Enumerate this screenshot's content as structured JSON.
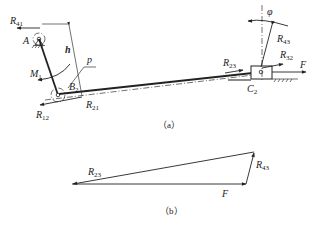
{
  "figure": {
    "part_a": {
      "caption": "（a）",
      "labels": {
        "R41": {
          "main": "R",
          "sub": "41"
        },
        "A": "A",
        "h": "h",
        "p": "p",
        "M1": {
          "main": "M",
          "sub": "1"
        },
        "B2": {
          "main": "B",
          "sub": "2"
        },
        "R12": {
          "main": "R",
          "sub": "12"
        },
        "R21": {
          "main": "R",
          "sub": "21"
        },
        "phi": "φ",
        "R43": {
          "main": "R",
          "sub": "43"
        },
        "R32": {
          "main": "R",
          "sub": "32"
        },
        "R23": {
          "main": "R",
          "sub": "23"
        },
        "F": "F",
        "C2": {
          "main": "C",
          "sub": "2"
        }
      }
    },
    "part_b": {
      "caption": "（b）",
      "labels": {
        "R23": {
          "main": "R",
          "sub": "23"
        },
        "R43": {
          "main": "R",
          "sub": "43"
        },
        "F": "F"
      }
    }
  }
}
